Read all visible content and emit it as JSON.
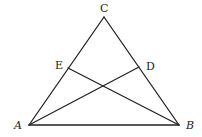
{
  "diagram": {
    "type": "geometry-triangle",
    "points": {
      "A": {
        "x": 29,
        "y": 125
      },
      "B": {
        "x": 179,
        "y": 125
      },
      "C": {
        "x": 104,
        "y": 17
      },
      "D": {
        "x": 139,
        "y": 67
      },
      "E": {
        "x": 68,
        "y": 68
      }
    },
    "segments": [
      {
        "from": "A",
        "to": "B"
      },
      {
        "from": "B",
        "to": "C"
      },
      {
        "from": "C",
        "to": "A"
      },
      {
        "from": "A",
        "to": "D"
      },
      {
        "from": "B",
        "to": "E"
      }
    ],
    "labels": [
      {
        "text": "C",
        "x": 100,
        "y": 12,
        "italic": false
      },
      {
        "text": "E",
        "x": 55,
        "y": 69,
        "italic": false
      },
      {
        "text": "D",
        "x": 146,
        "y": 70,
        "italic": false
      },
      {
        "text": "A",
        "x": 14,
        "y": 129,
        "italic": true
      },
      {
        "text": "B",
        "x": 186,
        "y": 129,
        "italic": true
      }
    ],
    "stroke_color": "#222222",
    "background": "#ffffff"
  }
}
